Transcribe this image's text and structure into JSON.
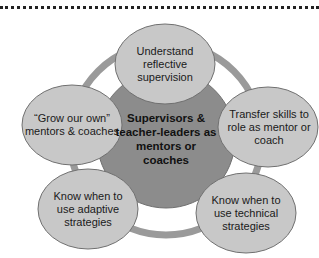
{
  "diagram": {
    "type": "cycle",
    "center": {
      "text": "Supervisors & teacher-leaders as mentors or coaches"
    },
    "nodes": [
      {
        "id": "top",
        "text": "Understand reflective supervision"
      },
      {
        "id": "right",
        "text": "Transfer skills to role as mentor or coach"
      },
      {
        "id": "bottom-right",
        "text": "Know when to use technical strategies"
      },
      {
        "id": "bottom-left",
        "text": "Know when to use adaptive strategies"
      },
      {
        "id": "left",
        "text": "“Grow our own” mentors & coaches"
      }
    ],
    "colors": {
      "center_fill": "#8c8c8c",
      "node_fill": "#c8c8c8",
      "ring": "#9a9a9a",
      "outline": "#6e6e6e"
    }
  }
}
